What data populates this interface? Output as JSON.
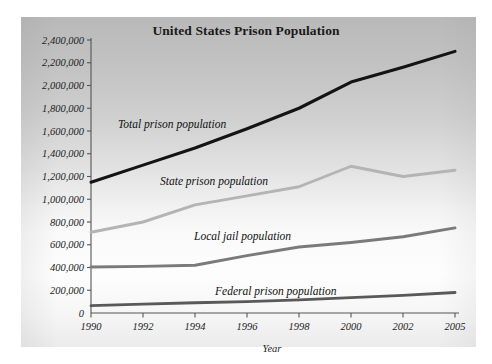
{
  "chart_data": {
    "type": "line",
    "title": "United States Prison Population",
    "xlabel": "Year",
    "ylabel": "",
    "categories": [
      "1990",
      "1992",
      "1994",
      "1996",
      "1998",
      "2000",
      "2002",
      "2005"
    ],
    "x_tick_labels": [
      "1990",
      "1992",
      "1994",
      "1996",
      "1998",
      "2000",
      "2002",
      "2005"
    ],
    "y_tick_labels": [
      "0",
      "200,000",
      "400,000",
      "600,000",
      "800,000",
      "1,000,000",
      "1,200,000",
      "1,400,000",
      "1,600,000",
      "1,800,000",
      "2,000,000",
      "2,200,000",
      "2,400,000"
    ],
    "y_tick_values": [
      0,
      200000,
      400000,
      600000,
      800000,
      1000000,
      1200000,
      1400000,
      1600000,
      1800000,
      2000000,
      2200000,
      2400000
    ],
    "ylim": [
      0,
      2400000
    ],
    "grid": false,
    "legend_position": "inline-labels",
    "series": [
      {
        "name": "Total prison population",
        "color": "#141414",
        "width": 3.1,
        "label_x": 118,
        "label_y": 128,
        "values": [
          1150000,
          1300000,
          1450000,
          1620000,
          1800000,
          2030000,
          2160000,
          2300000
        ]
      },
      {
        "name": "State prison population",
        "color": "#b4b4b4",
        "width": 2.9,
        "label_x": 160,
        "label_y": 185,
        "values": [
          710000,
          800000,
          950000,
          1030000,
          1110000,
          1290000,
          1200000,
          1255000
        ]
      },
      {
        "name": "Local jail population",
        "color": "#7a7a7a",
        "width": 2.9,
        "label_x": 194,
        "label_y": 240,
        "values": [
          405000,
          410000,
          420000,
          505000,
          580000,
          620000,
          670000,
          748000
        ]
      },
      {
        "name": "Federal prison population",
        "color": "#595959",
        "width": 2.9,
        "label_x": 215,
        "label_y": 295,
        "values": [
          65000,
          78000,
          90000,
          100000,
          115000,
          135000,
          155000,
          180000
        ]
      }
    ],
    "colors": {
      "plate_top": "#b9b9b9",
      "plate_bottom": "#ebebeb",
      "axis": "#555555",
      "text": "#222222",
      "title": "#1a1a1a"
    }
  }
}
